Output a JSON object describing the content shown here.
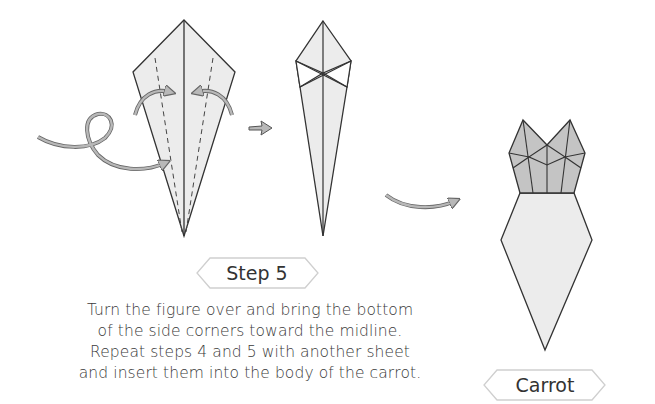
{
  "step_label": "Step 5",
  "final_label": "Carrot",
  "instructions": [
    "Turn the figure over and bring the bottom",
    "of the side corners toward the midline.",
    "Repeat steps 4 and 5 with another sheet",
    "and insert them into the body of the carrot."
  ],
  "colors": {
    "paper_light": "#ececec",
    "paper_dark": "#c4c4c4",
    "line": "#333333",
    "arrow_fill": "#b8b8b8",
    "label_border": "#cccccc"
  }
}
